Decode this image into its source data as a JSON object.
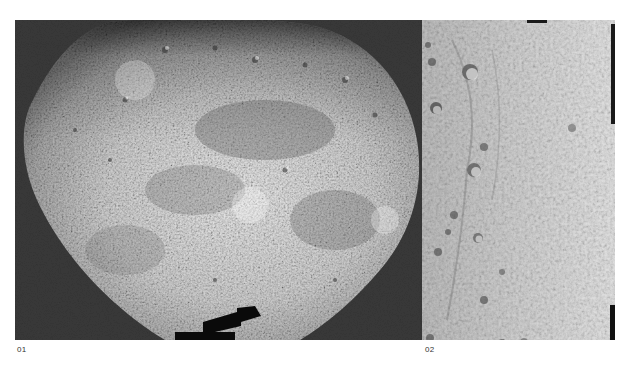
{
  "page": {
    "header_fragment": "· · · · ·"
  },
  "figures": [
    {
      "id": "01",
      "caption": "01",
      "subject": "planet-globe-photo",
      "description": "Grayscale mosaic of a heavily cratered planetary globe against a dark background, top cropped, with a black notch at the bottom edge",
      "colors": {
        "background": "#333333",
        "surface_light": "#e4e4e4",
        "surface_mid": "#9a9a9a",
        "surface_dark": "#5a5a5a",
        "notch": "#0a0a0a"
      }
    },
    {
      "id": "02",
      "caption": "02",
      "subject": "cratered-surface-closeup",
      "description": "Grayscale close-up mosaic strip of a cratered surface with a dark vertical band at the right edge",
      "colors": {
        "surface_light": "#d6d6d6",
        "surface_mid": "#b0b0b0",
        "crater_shadow": "#4a4a4a",
        "edge_band": "#1a1a1a"
      }
    }
  ]
}
